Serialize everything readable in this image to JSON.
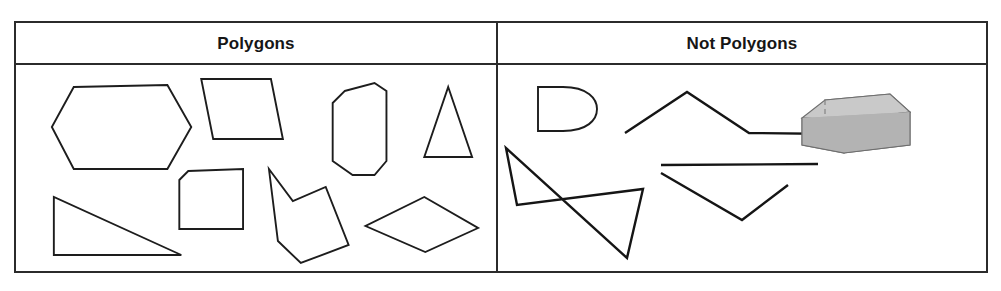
{
  "table": {
    "columns": [
      {
        "key": "polygons",
        "header": "Polygons",
        "shapes": [
          {
            "name": "hexagon",
            "label": "hexagon"
          },
          {
            "name": "trapezoid",
            "label": "trapezoid"
          },
          {
            "name": "octagon",
            "label": "octagon"
          },
          {
            "name": "triangle",
            "label": "triangle"
          },
          {
            "name": "right-triangle",
            "label": "right triangle"
          },
          {
            "name": "cut-corner-square",
            "label": "square with cut corner"
          },
          {
            "name": "concave-hexagon",
            "label": "concave hexagon"
          },
          {
            "name": "rhombus",
            "label": "rhombus"
          }
        ]
      },
      {
        "key": "not_polygons",
        "header": "Not Polygons",
        "shapes": [
          {
            "name": "d-shape-curved",
            "label": "D shape with curved side"
          },
          {
            "name": "triangle-with-extended-line",
            "label": "triangle with extended base line"
          },
          {
            "name": "self-intersecting-quadrilateral",
            "label": "self-intersecting quadrilateral"
          },
          {
            "name": "open-v-with-line",
            "label": "open V with separate line"
          },
          {
            "name": "three-dimensional-box",
            "label": "three-dimensional rectangular prism"
          }
        ]
      }
    ]
  },
  "colors": {
    "border": "#2b2b2b",
    "shape_stroke": "#1d1d1d",
    "box_top": "#c9c9c9",
    "box_front": "#b3b3b3",
    "box_side": "#a0a0a0",
    "background": "#ffffff"
  }
}
